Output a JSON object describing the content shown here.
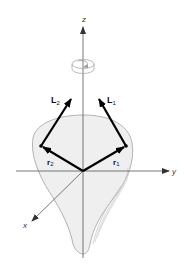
{
  "diagram": {
    "colors": {
      "background": "#ffffff",
      "body_fill": "#efefef",
      "body_outline": "#aaaaaa",
      "axis": "#555555",
      "vector": "#000000",
      "text": "#333333"
    },
    "axes": {
      "z": {
        "label": "z"
      },
      "y": {
        "label": "y"
      },
      "x": {
        "label": "x"
      }
    },
    "vectors": {
      "L1": {
        "main": "L",
        "sub": "1"
      },
      "L2": {
        "main": "L",
        "sub": "2"
      },
      "r1": {
        "main": "r",
        "sub": "1"
      },
      "r2": {
        "main": "r",
        "sub": "2"
      }
    },
    "rotation_symbol": "counterclockwise rotation about z axis"
  }
}
